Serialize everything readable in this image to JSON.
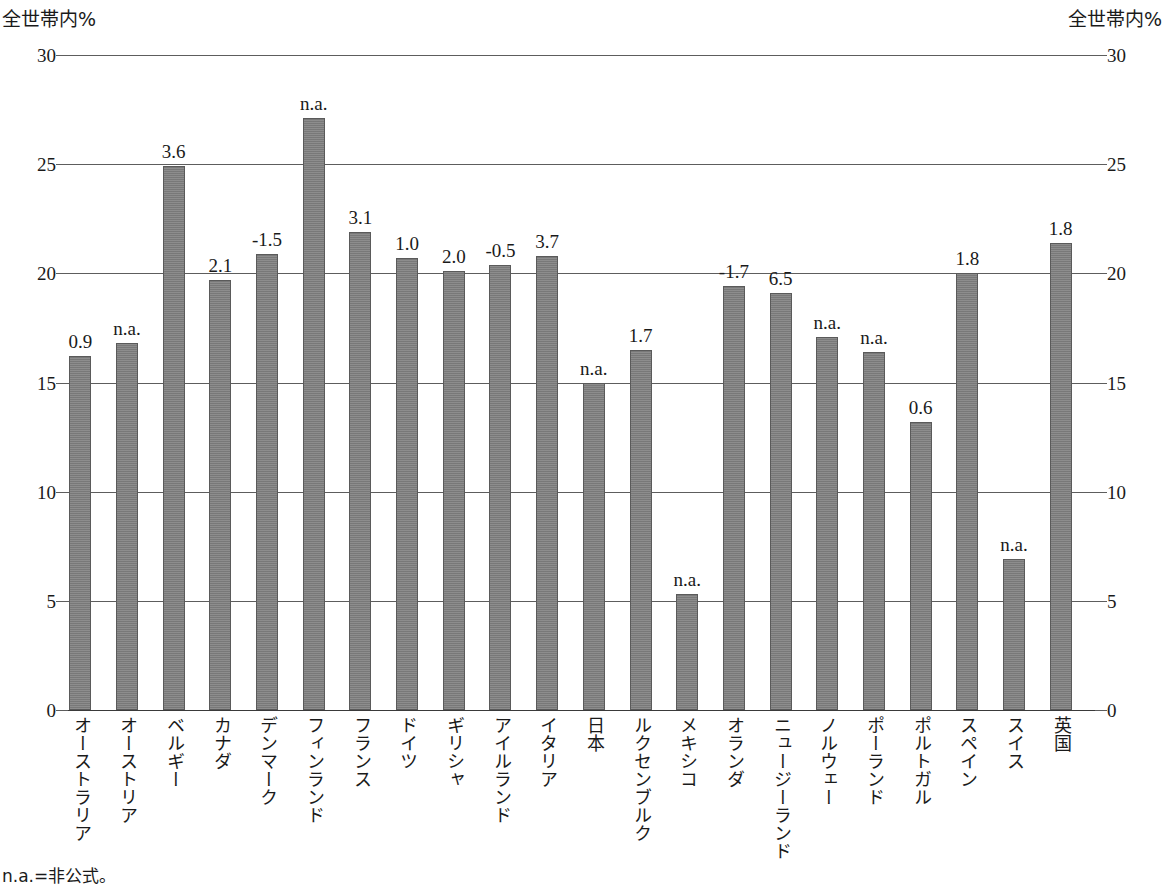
{
  "axis": {
    "left_unit_label": "全世帯内%",
    "right_unit_label": "全世帯内%"
  },
  "footnote": "n.a.=非公式。",
  "chart_data": {
    "type": "bar",
    "title": "",
    "subtitle": "",
    "xlabel": "",
    "ylabel": "全世帯内%",
    "ylabel_right": "全世帯内%",
    "ylim": [
      0,
      30
    ],
    "yticks": [
      0,
      5,
      10,
      15,
      20,
      25,
      30
    ],
    "ytick_labels": [
      "0",
      "5",
      "10",
      "15",
      "20",
      "25",
      "30"
    ],
    "grid": true,
    "legend": "none",
    "bar_color": "#808080",
    "bar_edge_color": "#5a5a5a",
    "note": "n.a.=非公式。",
    "data_label_note": "ラベルは変化量。n.a. は非公式を示す。",
    "categories": [
      "オーストラリア",
      "オーストリア",
      "ベルギー",
      "カナダ",
      "デンマーク",
      "フィンランド",
      "フランス",
      "ドイツ",
      "ギリシャ",
      "アイルランド",
      "イタリア",
      "日本",
      "ルクセンブルク",
      "メキシコ",
      "オランダ",
      "ニュージーランド",
      "ノルウェー",
      "ポーランド",
      "ポルトガル",
      "スペイン",
      "スイス",
      "英国"
    ],
    "values": [
      16.2,
      16.8,
      24.9,
      19.7,
      20.9,
      27.1,
      21.9,
      20.7,
      20.1,
      20.4,
      20.8,
      15.0,
      16.5,
      5.3,
      19.4,
      19.1,
      17.1,
      16.4,
      13.2,
      20.0,
      6.9,
      21.4
    ],
    "data_labels": [
      "0.9",
      "n.a.",
      "3.6",
      "2.1",
      "-1.5",
      "n.a.",
      "3.1",
      "1.0",
      "2.0",
      "-0.5",
      "3.7",
      "n.a.",
      "1.7",
      "n.a.",
      "-1.7",
      "6.5",
      "n.a.",
      "n.a.",
      "0.6",
      "1.8",
      "n.a.",
      "1.8"
    ]
  }
}
